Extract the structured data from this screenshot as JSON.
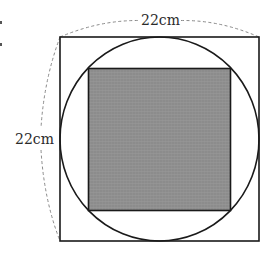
{
  "figure": {
    "type": "geometry",
    "outer_square": {
      "side_label_top": "22cm",
      "side_label_left": "22cm"
    },
    "circle": {
      "inscribed_in": "outer_square"
    },
    "inner_square": {
      "inscribed_in": "circle",
      "shaded": true
    },
    "colors": {
      "stroke": "#1a1a1a",
      "shade": "#8c8c8c",
      "shade_grid": "#a6a6a6",
      "dimension_line": "#8a8a8a",
      "label": "#2a2a2a"
    }
  }
}
